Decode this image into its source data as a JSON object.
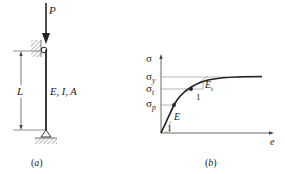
{
  "figure_a": {
    "load_label": "P",
    "length_label": "L",
    "properties_label": "E, I, A",
    "caption": "(a)"
  },
  "figure_b": {
    "y_axis_label": "σ",
    "x_axis_label": "e",
    "sigma_y": {
      "base": "σ",
      "sub": "y"
    },
    "sigma_t": {
      "base": "σ",
      "sub": "t"
    },
    "sigma_p": {
      "base": "σ",
      "sub": "p"
    },
    "elastic_modulus_label": "E",
    "tangent_modulus_label": {
      "base": "E",
      "sub": "t"
    },
    "slope_unit_1": "1",
    "slope_unit_2": "1",
    "caption": "(b)"
  },
  "colors": {
    "line": "#222222",
    "hatch": "#777777",
    "guide": "#888888"
  }
}
